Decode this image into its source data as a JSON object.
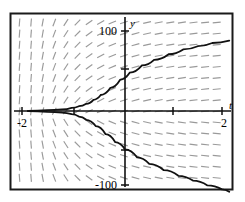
{
  "figure": {
    "type": "slope-field-plot",
    "background_color": "#ffffff",
    "border_color": "#1a1a1a",
    "frame": {
      "x": 10,
      "y": 13,
      "width": 223,
      "height": 177
    }
  },
  "chart_data": {
    "type": "line",
    "title": "",
    "subtitle": "",
    "xlabel": "t",
    "ylabel": "y",
    "xlim": [
      -2.2,
      2.2
    ],
    "ylim": [
      -118,
      118
    ],
    "grid": false,
    "legend": null,
    "axis_origin_px": {
      "x": 125,
      "y": 111
    },
    "x_ticks": [
      {
        "value": -2,
        "label": "-2",
        "px": 22
      },
      {
        "value": -1,
        "label": "",
        "px": 74
      },
      {
        "value": 1,
        "label": "",
        "px": 173
      },
      {
        "value": 2,
        "label": "2",
        "px": 222
      }
    ],
    "y_ticks": [
      {
        "value": 100,
        "label": "100",
        "px": 31
      },
      {
        "value": 50,
        "label": "",
        "px": 69
      },
      {
        "value": -50,
        "label": "",
        "px": 150
      },
      {
        "value": -100,
        "label": "-100",
        "px": 185
      }
    ],
    "tick_labels_x": [
      "-2",
      "2"
    ],
    "tick_labels_y": [
      "100",
      "-100"
    ],
    "series": [
      {
        "name": "upper-solution-curve",
        "color": "#111111",
        "style": "solid",
        "width": 1.8,
        "points": [
          [
            -2.0,
            0
          ],
          [
            -1.6,
            1
          ],
          [
            -1.3,
            2
          ],
          [
            -1.1,
            4
          ],
          [
            -0.95,
            6
          ],
          [
            -0.8,
            9
          ],
          [
            -0.65,
            14
          ],
          [
            -0.5,
            20
          ],
          [
            -0.3,
            29
          ],
          [
            -0.1,
            39
          ],
          [
            0.1,
            48
          ],
          [
            0.35,
            57
          ],
          [
            0.6,
            64
          ],
          [
            0.9,
            71
          ],
          [
            1.2,
            77
          ],
          [
            1.5,
            81
          ],
          [
            1.8,
            85
          ],
          [
            2.15,
            88
          ]
        ]
      },
      {
        "name": "lower-solution-curve",
        "color": "#111111",
        "style": "solid",
        "width": 1.8,
        "points": [
          [
            -2.0,
            0
          ],
          [
            -1.6,
            -1
          ],
          [
            -1.3,
            -2
          ],
          [
            -1.1,
            -4
          ],
          [
            -0.95,
            -7
          ],
          [
            -0.8,
            -11
          ],
          [
            -0.6,
            -19
          ],
          [
            -0.4,
            -29
          ],
          [
            -0.2,
            -39
          ],
          [
            0.0,
            -48
          ],
          [
            0.25,
            -58
          ],
          [
            0.5,
            -66
          ],
          [
            0.8,
            -74
          ],
          [
            1.1,
            -81
          ],
          [
            1.4,
            -87
          ],
          [
            1.7,
            -93
          ],
          [
            2.0,
            -98
          ],
          [
            2.15,
            -101
          ]
        ]
      }
    ],
    "slope_field": {
      "description": "Short gray dashes indicating direction field; slope = large negative/steep near left, shallow toward right.",
      "color": "#9a9a9a",
      "dash_length": 8,
      "spacing_x_px": 11.6,
      "spacing_y_px": 11.1,
      "columns": 19,
      "rows": 16,
      "quadrant_slopes": {
        "upper_left": "steep-positive-near-vertical",
        "lower_left": "steep-negative-near-vertical",
        "upper_right": "shallow-positive",
        "lower_right": "shallow-negative"
      }
    }
  },
  "labels": {
    "y_axis": "y",
    "t_axis": "t",
    "y_top": "100",
    "y_bottom": "-100",
    "x_left": "-2",
    "x_right": "2"
  }
}
